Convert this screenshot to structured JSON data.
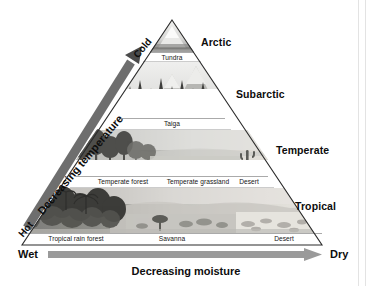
{
  "figure": {
    "shape": "triangle"
  },
  "zones": [
    {
      "name": "Arctic",
      "label": "Arctic"
    },
    {
      "name": "Subarctic",
      "label": "Subarctic"
    },
    {
      "name": "Temperate",
      "label": "Temperate"
    },
    {
      "name": "Tropical",
      "label": "Tropical"
    }
  ],
  "bands": [
    {
      "zone": "Arctic",
      "biomes": [
        {
          "label": "Tundra"
        }
      ]
    },
    {
      "zone": "Subarctic",
      "biomes": [
        {
          "label": "Taiga"
        }
      ]
    },
    {
      "zone": "Temperate",
      "biomes": [
        {
          "label": "Temperate forest"
        },
        {
          "label": "Temperate grassland"
        },
        {
          "label": "Desert"
        }
      ]
    },
    {
      "zone": "Tropical",
      "biomes": [
        {
          "label": "Tropical rain forest"
        },
        {
          "label": "Savanna"
        },
        {
          "label": "Desert"
        }
      ]
    }
  ],
  "axes": {
    "moisture": {
      "start_label": "Wet",
      "end_label": "Dry",
      "caption": "Decreasing moisture",
      "arrow_color": "#9a9a9a",
      "direction": "left-to-right"
    },
    "temperature": {
      "start_label": "Hot",
      "end_label": "Cold",
      "caption": "Decreasing temperature",
      "arrow_color": "#6e6e6e",
      "direction": "bottom-left-to-top-right"
    }
  },
  "colors": {
    "outline": "#2b2b2b",
    "text": "#0d0d0d",
    "background": "#ffffff",
    "moisture_arrow": "#9a9a9a",
    "temperature_arrow": "#6e6e6e"
  }
}
